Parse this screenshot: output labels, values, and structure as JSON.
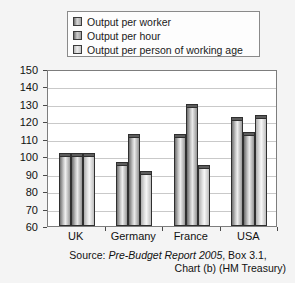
{
  "chart_data": {
    "type": "bar",
    "title": "",
    "subtitle": "",
    "xlabel": "",
    "ylabel": "",
    "categories": [
      "UK",
      "Germany",
      "France",
      "USA"
    ],
    "series": [
      {
        "name": "Output per worker",
        "values": [
          100,
          95,
          111,
          121
        ]
      },
      {
        "name": "Output per hour",
        "values": [
          100,
          111,
          128,
          112
        ]
      },
      {
        "name": "Output per person of working age",
        "values": [
          100,
          90,
          93,
          122
        ]
      }
    ],
    "ylim": [
      60,
      150
    ],
    "ytick_values": [
      60,
      70,
      80,
      90,
      100,
      110,
      120,
      130,
      140,
      150
    ],
    "ytick_labels": [
      "60",
      "70",
      "80",
      "90",
      "100",
      "110",
      "120",
      "130",
      "140",
      "150"
    ],
    "grid": true,
    "legend_position": "top",
    "baseline_note": "UK = 100 index baseline"
  },
  "legend": {
    "items": [
      {
        "label": "Output per worker",
        "swatch": "legend-swatch-series-1"
      },
      {
        "label": "Output per hour",
        "swatch": "legend-swatch-series-2"
      },
      {
        "label": "Output per person of working age",
        "swatch": "legend-swatch-series-3"
      }
    ]
  },
  "source": {
    "prefix": "Source: ",
    "publication": "Pre-Budget Report 2005",
    "suffix": ", Box 3.1,",
    "line2": "Chart (b) (HM Treasury)"
  },
  "colors": {
    "background": "#f4f4f4",
    "plot_background": "#ffffff",
    "gridline": "#c9c9c9",
    "axis": "#7d7d7d",
    "bar_outline": "#2f2f2f",
    "text": "#111111"
  }
}
